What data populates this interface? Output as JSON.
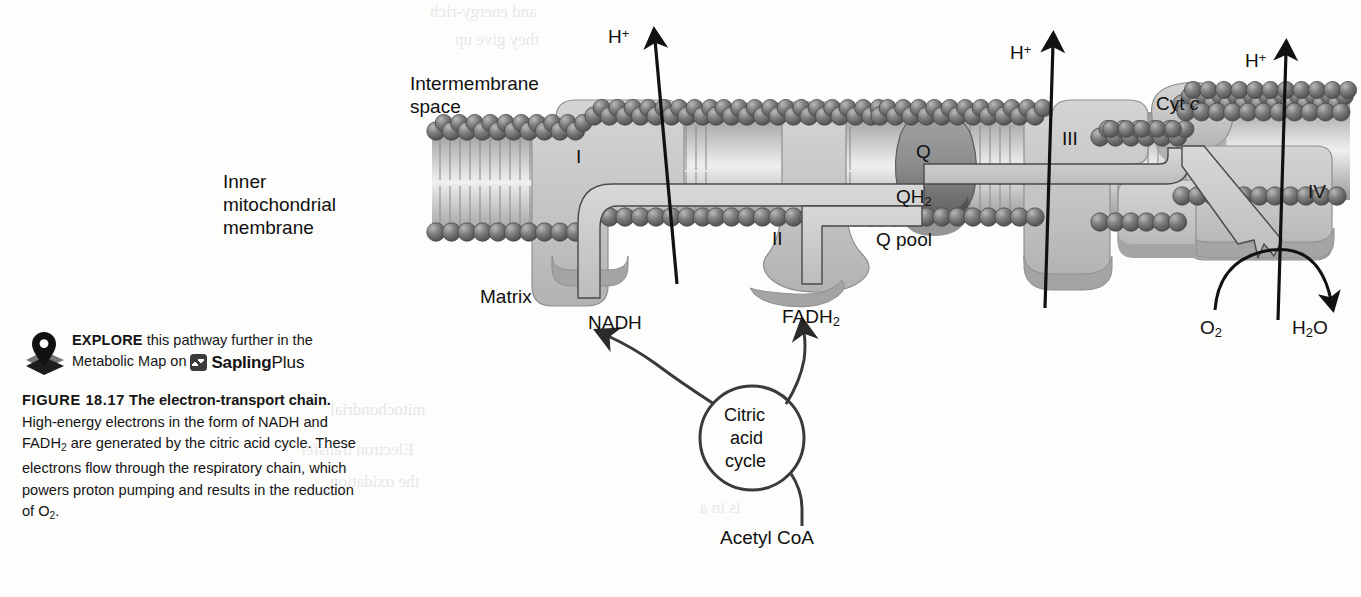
{
  "figure": {
    "number": "FIGURE 18.17",
    "title": "The electron-transport chain.",
    "body": "High-energy electrons in the form of NADH and FADH₂ are generated by the citric acid cycle. These electrons flow through the respiratory chain, which powers proton pumping and results in the reduction of O₂.",
    "body_lines": [
      "High-energy electrons in the form of",
      "NADH and FADH₂ are generated by the citric",
      "acid cycle. These electrons flow through the",
      "respiratory chain, which powers proton pump-",
      "ing and results in the reduction of O₂."
    ]
  },
  "explore": {
    "keyword": "EXPLORE",
    "line1_rest": " this pathway further in the",
    "line2": "Metabolic Map on",
    "brand_name": "Sapling",
    "brand_suffix": "Plus",
    "icon": "map-pin-icon"
  },
  "diagram": {
    "regions": {
      "intermembrane_space": "Intermembrane\nspace",
      "intermembrane_space_l1": "Intermembrane",
      "intermembrane_space_l2": "space",
      "inner_membrane_l1": "Inner",
      "inner_membrane_l2": "mitochondrial",
      "inner_membrane_l3": "membrane",
      "matrix": "Matrix"
    },
    "complexes": [
      {
        "id": "I",
        "label": "I"
      },
      {
        "id": "II",
        "label": "II"
      },
      {
        "id": "III",
        "label": "III"
      },
      {
        "id": "IV",
        "label": "IV"
      }
    ],
    "carriers": {
      "q": "Q",
      "qh2_main": "QH",
      "qh2_sub": "2",
      "q_pool": "Q pool",
      "cyt_c_prefix": "Cyt ",
      "cyt_c_italic": "c"
    },
    "proton_labels": [
      {
        "name": "proton-1",
        "main": "H",
        "sup": "+"
      },
      {
        "name": "proton-2",
        "main": "H",
        "sup": "+"
      },
      {
        "name": "proton-3",
        "main": "H",
        "sup": "+"
      }
    ],
    "substrates": {
      "nadh": "NADH",
      "fadh2_main": "FADH",
      "fadh2_sub": "2",
      "o2_main": "O",
      "o2_sub": "2",
      "h2o_h": "H",
      "h2o_sub": "2",
      "h2o_o": "O",
      "acetyl_coa": "Acetyl CoA"
    },
    "cycle": {
      "line1": "Citric",
      "line2": "acid",
      "line3": "cycle"
    }
  },
  "bleed_text": [
    {
      "t": "and energy-rich",
      "x": 430,
      "y": 2,
      "s": 17
    },
    {
      "t": "they give up",
      "x": 455,
      "y": 30,
      "s": 17
    },
    {
      "t": "mitochondrial",
      "x": 330,
      "y": 400,
      "s": 17
    },
    {
      "t": "Electron transfer",
      "x": 300,
      "y": 440,
      "s": 17
    },
    {
      "t": "the oxidation",
      "x": 330,
      "y": 472,
      "s": 17
    },
    {
      "t": "is in a",
      "x": 700,
      "y": 498,
      "s": 17
    }
  ],
  "colors": {
    "protein_fill": "#c6c6c6",
    "protein_shade": "#a9a9a9",
    "membrane_head": "#6e6e6e",
    "qpool_fill": "#8e8e8e",
    "ink": "#141414",
    "background": "#fdfdfc"
  }
}
